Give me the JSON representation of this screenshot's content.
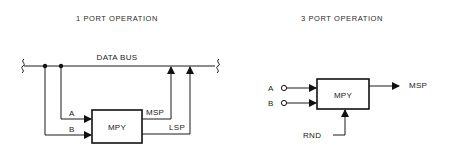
{
  "left_diagram": {
    "title": "1 PORT OPERATION",
    "bus_label": "DATA BUS",
    "block_label": "MPY",
    "inputs": [
      "A",
      "B"
    ],
    "outputs": [
      "MSP",
      "LSP"
    ]
  },
  "right_diagram": {
    "title": "3 PORT OPERATION",
    "block_label": "MPY",
    "inputs": [
      "A",
      "B"
    ],
    "output": "MSP",
    "control_input": "RND"
  },
  "colors": {
    "line": "#1a1a1a",
    "background": "#ffffff"
  }
}
